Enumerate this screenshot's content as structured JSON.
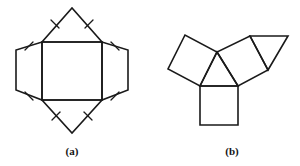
{
  "figure": {
    "caption_a": "(a)",
    "caption_b": "(b)",
    "label_a_x": 72,
    "label_a_y": 145,
    "label_b_x": 232,
    "label_b_y": 145,
    "stroke_color": "#1a1a1a",
    "background_color": "#ffffff",
    "canvas": {
      "width": 300,
      "height": 166
    }
  },
  "diagram_data": {
    "type": "geometric-net-diagram",
    "description": "Two polyhedron nets (planar unfoldings) labeled (a) and (b)",
    "panels": [
      {
        "id": "a",
        "caption": "(a)",
        "description": "Net of a pentahedron-like solid: central rectangle flanked left and right by trapezoids and above and below by triangles; congruent edges marked with single tick marks",
        "faces": [
          {
            "name": "central-rectangle",
            "shape": "rectangle",
            "points": "42,42 102,42 102,100 42,100"
          },
          {
            "name": "top-triangle",
            "shape": "triangle",
            "points": "42,42 102,42 72,8"
          },
          {
            "name": "bottom-triangle",
            "shape": "triangle",
            "points": "42,100 102,100 72,133"
          },
          {
            "name": "left-trapezoid",
            "shape": "trapezoid",
            "points": "42,42 42,100 16,90 16,50"
          },
          {
            "name": "right-trapezoid",
            "shape": "trapezoid",
            "points": "102,42 102,100 128,90 128,50"
          }
        ],
        "tick_marks": [
          {
            "name": "tick-top-left-slant",
            "x1": 51,
            "y1": 20,
            "x2": 59,
            "y2": 28
          },
          {
            "name": "tick-top-right-slant",
            "x1": 85,
            "y1": 28,
            "x2": 93,
            "y2": 20
          },
          {
            "name": "tick-bottom-left-slant",
            "x1": 52,
            "y1": 120,
            "x2": 60,
            "y2": 112
          },
          {
            "name": "tick-bottom-right-slant",
            "x1": 84,
            "y1": 112,
            "x2": 92,
            "y2": 120
          },
          {
            "name": "tick-left-upper-slant",
            "x1": 25,
            "y1": 50,
            "x2": 33,
            "y2": 42
          },
          {
            "name": "tick-left-lower-slant",
            "x1": 25,
            "y1": 92,
            "x2": 33,
            "y2": 100
          },
          {
            "name": "tick-right-upper-slant",
            "x1": 111,
            "y1": 42,
            "x2": 119,
            "y2": 50
          },
          {
            "name": "tick-right-lower-slant",
            "x1": 111,
            "y1": 100,
            "x2": 119,
            "y2": 92
          }
        ]
      },
      {
        "id": "b",
        "caption": "(b)",
        "description": "Net arranged around a central triangle: a square on each of the three triangle edges, with one extra triangle attached to the outer edge of the right square",
        "faces": [
          {
            "name": "central-triangle",
            "shape": "triangle",
            "points": "217,52 238,86 200,86"
          },
          {
            "name": "bottom-square",
            "shape": "square",
            "points": "200,86 238,86 238,125 200,125"
          },
          {
            "name": "left-square",
            "shape": "square",
            "points": "200,86 217,52 185,35 168,69"
          },
          {
            "name": "right-square",
            "shape": "square",
            "points": "217,52 238,86 268,70 250,36"
          },
          {
            "name": "right-triangle-flap",
            "shape": "triangle",
            "points": "250,36 288,36 268,70"
          }
        ],
        "tick_marks": []
      }
    ]
  }
}
